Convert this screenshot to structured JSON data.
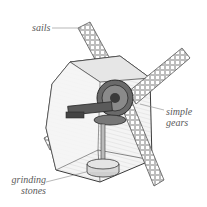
{
  "diagram": {
    "labels": {
      "sails": "sails",
      "simple_gears_line1": "simple",
      "simple_gears_line2": "gears",
      "grinding_stones_line1": "grinding",
      "grinding_stones_line2": "stones"
    },
    "colors": {
      "background": "#ffffff",
      "line": "#3a3a3a",
      "sail_fill": "#d9d9d9",
      "housing_fill": "#efefef",
      "housing_shade": "#cfcfcf",
      "gear_dark": "#4a4a4a",
      "label_text": "#5a5a5a",
      "leader_line": "#888888"
    }
  }
}
